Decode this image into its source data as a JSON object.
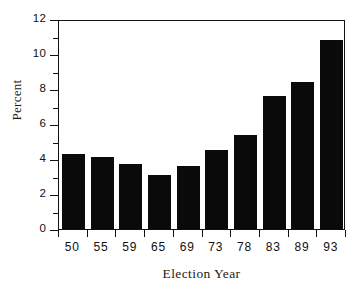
{
  "chart_data": {
    "type": "bar",
    "title": "",
    "xlabel": "Election Year",
    "ylabel": "Percent",
    "categories": [
      "50",
      "55",
      "59",
      "65",
      "69",
      "73",
      "78",
      "83",
      "89",
      "93"
    ],
    "values": [
      4.3,
      4.1,
      3.7,
      3.1,
      3.6,
      4.5,
      5.4,
      7.6,
      8.4,
      10.8
    ],
    "ylim": [
      0,
      12
    ],
    "ytick_labels": [
      "0",
      "2",
      "4",
      "6",
      "8",
      "10",
      "12"
    ],
    "ytick_values": [
      0,
      2,
      4,
      6,
      8,
      10,
      12
    ],
    "yminor_values": [
      1,
      3,
      5,
      7,
      9,
      11
    ],
    "grid": false,
    "legend": null,
    "bar_color": "#0a0a0a",
    "frame_color": "#111111",
    "background": "#ffffff"
  }
}
